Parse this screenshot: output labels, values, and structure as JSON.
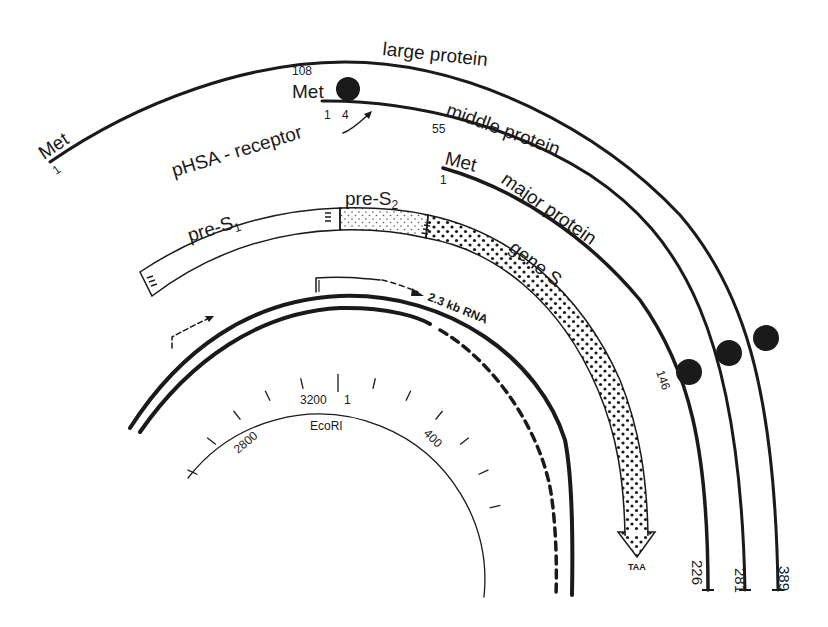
{
  "figure": {
    "proteins": [
      {
        "name": "large protein",
        "start_label": "Met",
        "start_index": "1",
        "end_index": "389"
      },
      {
        "name": "middle protein",
        "start_label": "Met",
        "start_index": "108",
        "end_index": "281",
        "internal_index": "55"
      },
      {
        "name": "major protein",
        "start_label": "Met",
        "start_index": "1",
        "end_index": "226",
        "glycosylation_index": "146"
      }
    ],
    "middle_start": {
      "met": "Met",
      "upper_index": "108",
      "index_1": "1",
      "index_4": "4"
    },
    "receptor_label": "pHSA - receptor",
    "regions": {
      "pre_s1": "pre-S",
      "pre_s1_sub": "1",
      "pre_s2": "pre-S",
      "pre_s2_sub": "2",
      "gene_s": "gene S"
    },
    "stop_codon": "TAA",
    "rna_label": "2.3 kb RNA",
    "scale": {
      "site_label": "EcoRI",
      "ticks": [
        "2800",
        "3200",
        "1",
        "400"
      ]
    }
  }
}
